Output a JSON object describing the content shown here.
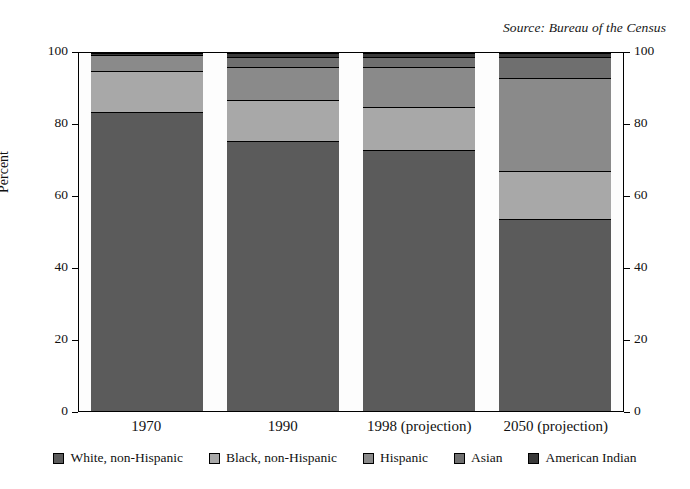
{
  "source_note": "Source: Bureau of the Census",
  "axis": {
    "y_title": "Percent",
    "y_ticks": [
      "0",
      "20",
      "40",
      "60",
      "80",
      "100"
    ],
    "y_ticks_right": [
      "0",
      "20",
      "40",
      "60",
      "80",
      "100"
    ]
  },
  "legend": [
    {
      "label": "White, non-Hispanic",
      "color": "#5b5b5b"
    },
    {
      "label": "Black, non-Hispanic",
      "color": "#a8a8a8"
    },
    {
      "label": "Hispanic",
      "color": "#8a8a8a"
    },
    {
      "label": "Asian",
      "color": "#6f6f6f"
    },
    {
      "label": "American Indian",
      "color": "#3a3a3a"
    }
  ],
  "chart_data": {
    "type": "bar",
    "subtype": "stacked-bar",
    "title": "",
    "subtitle": "",
    "xlabel": "",
    "ylabel": "Percent",
    "ylim": [
      0,
      100
    ],
    "grid": false,
    "legend_position": "bottom",
    "categories": [
      "1970",
      "1990",
      "1998 (projection)",
      "2050 (projection)"
    ],
    "series": [
      {
        "name": "White, non-Hispanic",
        "color": "#5b5b5b",
        "values": [
          83.5,
          75.5,
          73.0,
          53.5
        ]
      },
      {
        "name": "Black, non-Hispanic",
        "color": "#a8a8a8",
        "values": [
          11.5,
          11.5,
          12.0,
          13.5
        ]
      },
      {
        "name": "Hispanic",
        "color": "#8a8a8a",
        "values": [
          4.5,
          9.0,
          11.0,
          26.0
        ]
      },
      {
        "name": "Asian",
        "color": "#6f6f6f",
        "values": [
          0.0,
          3.0,
          3.0,
          6.0
        ]
      },
      {
        "name": "American Indian",
        "color": "#3a3a3a",
        "values": [
          0.5,
          1.0,
          1.0,
          1.0
        ]
      }
    ]
  }
}
